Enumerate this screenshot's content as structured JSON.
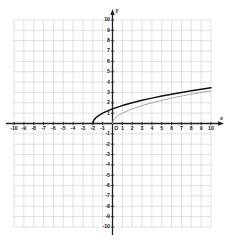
{
  "figure": {
    "type": "cartesian-graph",
    "background": "#ffffff",
    "grid_color": "#c8ccd2",
    "axis_color": "#202020",
    "origin_label": "O",
    "x_axis_label": "x",
    "y_axis_label": "y"
  },
  "chart_data": {
    "type": "line",
    "title": "",
    "xlabel": "x",
    "ylabel": "y",
    "xlim": [
      -10,
      10
    ],
    "ylim": [
      -10,
      10
    ],
    "grid": true,
    "legend": "none",
    "x_ticks": [
      -10,
      -9,
      -8,
      -7,
      -6,
      -5,
      -4,
      -3,
      -2,
      -1,
      1,
      2,
      3,
      4,
      5,
      6,
      7,
      8,
      9,
      10
    ],
    "x_tick_labels": [
      "-10",
      "-9",
      "-8",
      "-7",
      "-6",
      "-5",
      "-4",
      "-3",
      "-2",
      "-1",
      "1",
      "2",
      "3",
      "4",
      "5",
      "6",
      "7",
      "8",
      "9",
      "10"
    ],
    "y_ticks": [
      10,
      9,
      8,
      7,
      6,
      5,
      4,
      3,
      2,
      1,
      -1,
      -2,
      -3,
      -4,
      -5,
      -6,
      -7,
      -8,
      -9,
      -10
    ],
    "y_tick_labels": [
      "10",
      "9",
      "8",
      "7",
      "6",
      "5",
      "4",
      "3",
      "2",
      "1",
      "-1",
      "-2",
      "-3",
      "-4",
      "-5",
      "-6",
      "-7",
      "-8",
      "-9",
      "-10"
    ],
    "series": [
      {
        "name": "y = sqrt(x + 2)",
        "color": "#111111",
        "width": 1.5,
        "domain_start": -2,
        "domain_end": 10,
        "points": [
          {
            "x": -2.0,
            "y": 0.0
          },
          {
            "x": -1.9,
            "y": 0.32
          },
          {
            "x": -1.8,
            "y": 0.45
          },
          {
            "x": -1.6,
            "y": 0.63
          },
          {
            "x": -1.4,
            "y": 0.77
          },
          {
            "x": -1.0,
            "y": 1.0
          },
          {
            "x": -0.5,
            "y": 1.22
          },
          {
            "x": 0.0,
            "y": 1.41
          },
          {
            "x": 1.0,
            "y": 1.73
          },
          {
            "x": 2.0,
            "y": 2.0
          },
          {
            "x": 3.0,
            "y": 2.24
          },
          {
            "x": 4.0,
            "y": 2.45
          },
          {
            "x": 5.0,
            "y": 2.65
          },
          {
            "x": 6.0,
            "y": 2.83
          },
          {
            "x": 7.0,
            "y": 3.0
          },
          {
            "x": 8.0,
            "y": 3.16
          },
          {
            "x": 9.0,
            "y": 3.32
          },
          {
            "x": 10.0,
            "y": 3.46
          }
        ]
      },
      {
        "name": "y = sqrt(x)",
        "color": "#a8a8a8",
        "width": 1.0,
        "domain_start": 0,
        "domain_end": 10,
        "points": [
          {
            "x": 0.0,
            "y": 0.0
          },
          {
            "x": 0.1,
            "y": 0.32
          },
          {
            "x": 0.25,
            "y": 0.5
          },
          {
            "x": 0.5,
            "y": 0.71
          },
          {
            "x": 1.0,
            "y": 1.0
          },
          {
            "x": 2.0,
            "y": 1.41
          },
          {
            "x": 3.0,
            "y": 1.73
          },
          {
            "x": 4.0,
            "y": 2.0
          },
          {
            "x": 5.0,
            "y": 2.24
          },
          {
            "x": 6.0,
            "y": 2.45
          },
          {
            "x": 7.0,
            "y": 2.65
          },
          {
            "x": 8.0,
            "y": 2.83
          },
          {
            "x": 9.0,
            "y": 3.0
          },
          {
            "x": 10.0,
            "y": 3.16
          }
        ]
      }
    ]
  }
}
